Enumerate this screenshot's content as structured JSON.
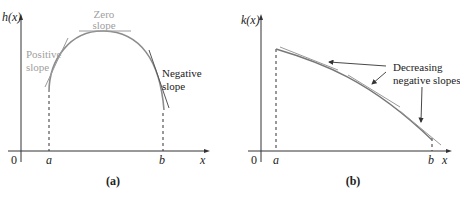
{
  "panel_a": {
    "y_label": "h(x)",
    "x_label": "x",
    "origin_label": "0",
    "a_label": "a",
    "b_label": "b",
    "caption": "(a)",
    "annotations": {
      "zero_slope_line1": "Zero",
      "zero_slope_line2": "slope",
      "positive_slope_line1": "Positive",
      "positive_slope_line2": "slope",
      "negative_slope_line1": "Negative",
      "negative_slope_line2": "slope"
    }
  },
  "panel_b": {
    "y_label": "k(x)",
    "x_label": "x",
    "origin_label": "0",
    "a_label": "a",
    "b_label": "b",
    "caption": "(b)",
    "annotations": {
      "decreasing_line1": "Decreasing",
      "decreasing_line2": "negative slopes"
    }
  },
  "colors": {
    "axis": "#333333",
    "curve": "#8c8c8c",
    "tangent": "#9a9a9a",
    "dark_text": "#222222",
    "gray_text": "#a0a0a0"
  }
}
